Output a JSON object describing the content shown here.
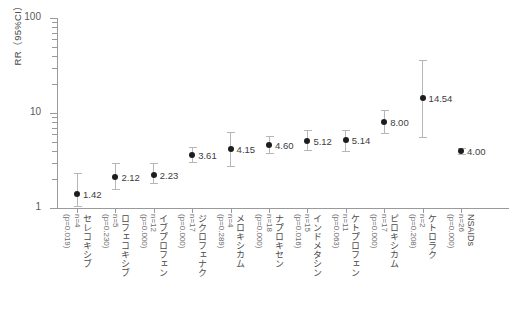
{
  "chart_data": {
    "type": "scatter",
    "title": "",
    "xlabel": "",
    "ylabel": "RR（95%CI）",
    "yscale": "log",
    "ylim": [
      1,
      100
    ],
    "ytick_labels": [
      "1",
      "10",
      "100"
    ],
    "ytick_values": [
      1,
      10,
      100
    ],
    "grid": false,
    "legend": "none",
    "categories": [
      "セレコキシブ",
      "ロフェコキシブ",
      "イブプロフェン",
      "ジクロフェナク",
      "メロキシカム",
      "ナプロキセン",
      "インドメタシン",
      "ケトプロフェン",
      "ピロキシカム",
      "ケトロラク",
      "NSAIDs"
    ],
    "values": [
      1.42,
      2.12,
      2.23,
      3.61,
      4.15,
      4.6,
      5.12,
      5.14,
      8.0,
      14.54,
      4.0
    ],
    "ci_low": [
      1.05,
      1.59,
      1.85,
      3.05,
      2.8,
      3.8,
      4.05,
      4.0,
      6.1,
      5.55,
      3.72
    ],
    "ci_high": [
      2.35,
      2.95,
      2.95,
      4.35,
      6.35,
      5.7,
      6.6,
      6.7,
      10.7,
      36.0,
      4.32
    ],
    "data_labels": [
      "1.42",
      "2.12",
      "2.23",
      "3.61",
      "4.15",
      "4.60",
      "5.12",
      "5.14",
      "8.00",
      "14.54",
      "4.00"
    ],
    "n_values": [
      "n=4",
      "n=5",
      "n=12",
      "n=17",
      "n=4",
      "n=18",
      "n=15",
      "n=11",
      "n=17",
      "n=2",
      "n=26"
    ],
    "p_values": [
      "(p=0.019)",
      "(p=0.230)",
      "(p=0.000)",
      "(p=0.000)",
      "(p=0.289)",
      "(p=0.000)",
      "(p=0.016)",
      "(p=0.063)",
      "(p=0.000)",
      "(p=0.208)",
      "(p=0.000)"
    ],
    "marker_color": "#1d1d1d",
    "errorbar_color": "#b6b6b6",
    "axis_color": "#9a9a9a"
  },
  "caption": ""
}
